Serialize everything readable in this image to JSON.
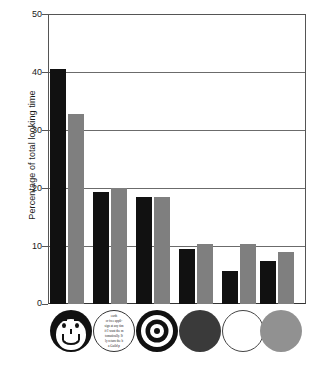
{
  "chart_data": {
    "type": "bar",
    "title": "",
    "xlabel": "",
    "ylabel": "Percentage of total looking time",
    "ylim": [
      0,
      50
    ],
    "yticks": [
      0,
      10,
      20,
      30,
      40,
      50
    ],
    "ytick_labels": [
      "0",
      "10",
      "20",
      "30",
      "40",
      "50"
    ],
    "grid": true,
    "legend": "none",
    "categories": [
      "face",
      "printed-matter",
      "bullseye",
      "red-disc",
      "white-disc",
      "yellow-disc"
    ],
    "category_icon_names": [
      "stimulus-face-icon",
      "stimulus-newsprint-icon",
      "stimulus-bullseye-icon",
      "stimulus-red-disc-icon",
      "stimulus-white-disc-icon",
      "stimulus-yellow-disc-icon"
    ],
    "series": [
      {
        "name": "2-3 months",
        "color": "#111111",
        "values": [
          40.5,
          19.3,
          18.4,
          9.4,
          5.7,
          7.4
        ]
      },
      {
        "name": "over 3 months",
        "color": "#7f7f7f",
        "values": [
          32.8,
          20.0,
          18.4,
          10.3,
          10.3,
          8.9
        ]
      }
    ]
  },
  "axis": {
    "y_title": "Percentage of total looking time",
    "tick_50": "50",
    "tick_40": "40",
    "tick_30": "30",
    "tick_20": "20",
    "tick_10": "10",
    "tick_0": "0"
  },
  "stimuli": {
    "newsprint_lines": [
      "earth",
      "or free  appli-",
      "sign at any tim",
      "if I want the m",
      "tomatically.  If",
      "ly return the b",
      "a Guild p"
    ]
  },
  "colors": {
    "series_black": "#111111",
    "series_gray": "#7f7f7f",
    "axis": "#555555",
    "grid": "#6b6b6b",
    "background": "#ffffff"
  }
}
